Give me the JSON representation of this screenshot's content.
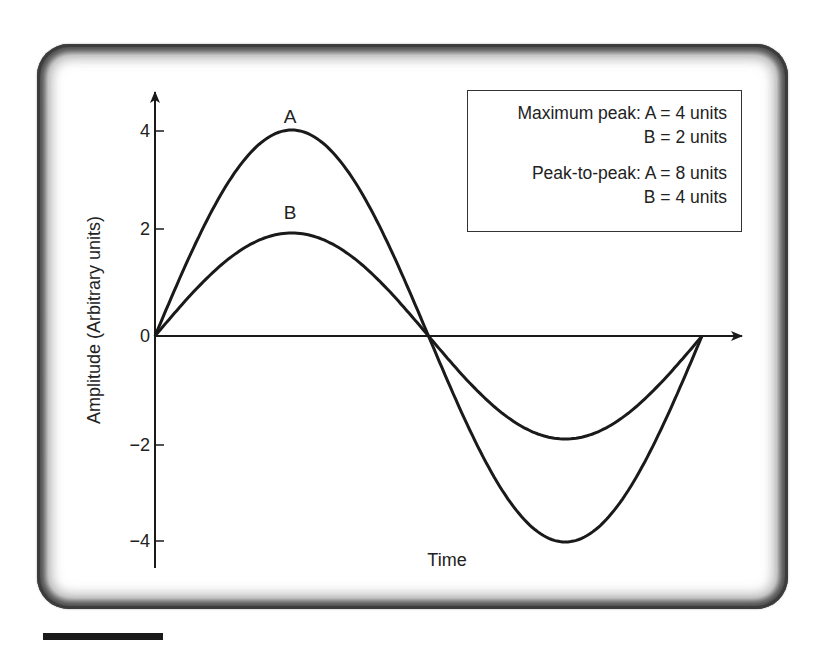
{
  "chart_data": {
    "type": "line",
    "title": "",
    "xlabel": "Time",
    "ylabel": "Amplitude (Arbitrary units)",
    "yticks": [
      4,
      2,
      0,
      -2,
      -4
    ],
    "ytick_labels": [
      "4",
      "2",
      "0",
      "−2",
      "−4"
    ],
    "ylim": [
      -4.5,
      4.5
    ],
    "grid": false,
    "legend_position": "top-right box",
    "x_description": "one full period of a sine wave",
    "series": [
      {
        "name": "A",
        "amplitude": 4,
        "x": [
          0,
          0.25,
          0.5,
          0.75,
          1.0
        ],
        "values": [
          0,
          4,
          0,
          -4,
          0
        ]
      },
      {
        "name": "B",
        "amplitude": 2,
        "x": [
          0,
          0.25,
          0.5,
          0.75,
          1.0
        ],
        "values": [
          0,
          2,
          0,
          -2,
          0
        ]
      }
    ],
    "annotations": {
      "maximum_peak": {
        "A": "4 units",
        "B": "2 units"
      },
      "peak_to_peak": {
        "A": "8 units",
        "B": "4 units"
      }
    }
  },
  "legend": {
    "line1": "Maximum peak: A = 4 units",
    "line2": "B = 2 units",
    "line3": "Peak-to-peak: A = 8 units",
    "line4": "B = 4 units"
  },
  "labels": {
    "curve_a": "A",
    "curve_b": "B",
    "x_axis": "Time",
    "y_axis": "Amplitude (Arbitrary units)",
    "ticks": [
      "4",
      "2",
      "0",
      "−2",
      "−4"
    ]
  },
  "colors": {
    "line": "#1a1a1a",
    "frame": "#4a4a4a"
  }
}
